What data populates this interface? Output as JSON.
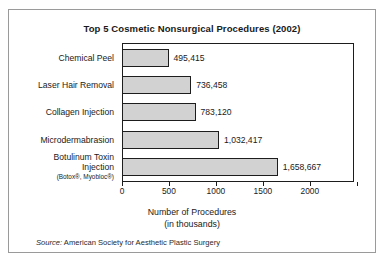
{
  "chart_data": {
    "type": "bar",
    "orientation": "horizontal",
    "title": "Top 5 Cosmetic Nonsurgical Procedures (2002)",
    "xlabel": "Number of Procedures",
    "xlabel_sub": "(in thousands)",
    "ylabel": "",
    "xlim": [
      0,
      2470
    ],
    "xticks": [
      0,
      500,
      1000,
      1500,
      2000
    ],
    "xticklabels": [
      "0",
      "500",
      "1000",
      "1500",
      "2000"
    ],
    "grid": false,
    "legend": false,
    "source_lead": "Source:",
    "source_text": " American Society for Aesthetic Plastic Surgery",
    "bar_fill": "#d2d2d2",
    "bar_stroke": "#1d1d1d",
    "categories": [
      "Chemical Peel",
      "Laser Hair Removal",
      "Collagen Injection",
      "Microdermabrasion",
      "Botulinum Toxin Injection"
    ],
    "values": [
      495.415,
      736.458,
      783.12,
      1032.417,
      1658.667
    ],
    "bars": [
      {
        "label": "Chemical Peel",
        "sublabel": "",
        "value": 495.415,
        "value_label": "495,415"
      },
      {
        "label": "Laser Hair Removal",
        "sublabel": "",
        "value": 736.458,
        "value_label": "736,458"
      },
      {
        "label": "Collagen Injection",
        "sublabel": "",
        "value": 783.12,
        "value_label": "783,120"
      },
      {
        "label": "Microdermabrasion",
        "sublabel": "",
        "value": 1032.417,
        "value_label": "1,032,417"
      },
      {
        "label_line1": "Botulinum Toxin",
        "label_line2": "Injection",
        "sublabel": "(Botox®, Myobloc®)",
        "value": 1658.667,
        "value_label": "1,658,667"
      }
    ]
  }
}
